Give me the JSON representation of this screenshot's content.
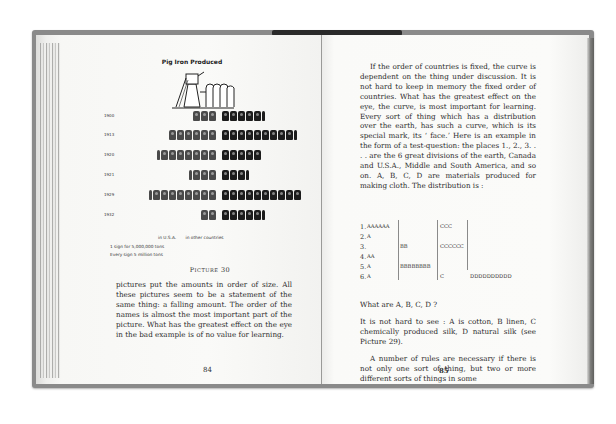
{
  "left_page": {
    "figure_title": "Pig Iron Produced",
    "caption": "Picture 30",
    "legend": {
      "usa": "in U.S.A.",
      "others": "in other countries",
      "note1": "1 sign for 5,000,000 tons",
      "note2": "Every sign 5 million tons"
    },
    "body_text": "pictures put the amounts in order of size. All these pictures seem to be a statement of the same thing: a falling amount. The order of the names is almost the most important part of the picture. What has the greatest effect on the eye in the bad example is of no value for learning.",
    "page_number": "84"
  },
  "chart_data": {
    "type": "bar",
    "title": "Pig Iron Produced",
    "subtitle": "Pictograph (isotype), 1 sign = 5,000,000 tons",
    "categories": [
      "1900",
      "1913",
      "1920",
      "1921",
      "1929",
      "1932"
    ],
    "series": [
      {
        "name": "in U.S.A.",
        "values": [
          3,
          6,
          7.5,
          3.5,
          8.5,
          2
        ]
      },
      {
        "name": "in other countries",
        "values": [
          5.5,
          9.5,
          5,
          3.5,
          10,
          5.5
        ]
      }
    ],
    "units": "signs (x 5 million tons)",
    "xlabel": "",
    "ylabel": "",
    "orientation": "horizontal",
    "grid": false,
    "legend_position": "bottom"
  },
  "right_page": {
    "para1": "If the order of countries is fixed, the curve is dependent on the thing under discussion. It is not hard to keep in memory the fixed order of countries. What has the greatest effect on the eye, the curve, is most important for learning. Every sort of thing which has a distribution over the earth, has such a curve, which is its special mark, its ‘ face.’ Here is an example in the form of a test-question: the places 1., 2., 3. . . . are the 6 great divisions of the earth, Canada and U.S.A., Middle and South America, and so on. A, B, C, D are materials produced for making cloth. The distribution is :",
    "distribution": [
      {
        "num": "1.",
        "a": "AAAAAA",
        "b": "",
        "c": "CCC",
        "d": ""
      },
      {
        "num": "2.",
        "a": "A",
        "b": "",
        "c": "",
        "d": ""
      },
      {
        "num": "3.",
        "a": "",
        "b": "BB",
        "c": "CCCCCC",
        "d": ""
      },
      {
        "num": "4.",
        "a": "AA",
        "b": "",
        "c": "",
        "d": ""
      },
      {
        "num": "5.",
        "a": "A",
        "b": "BBBBBBBB",
        "c": "",
        "d": ""
      },
      {
        "num": "6.",
        "a": "A",
        "b": "",
        "c": "C",
        "d": "DDDDDDDDDD"
      }
    ],
    "question": "What are A, B, C, D ?",
    "answer": "It is not hard to see : A is cotton, B linen, C chemically produced silk, D natural silk (see Picture 29).",
    "para3": "A number of rules are necessary if there is not only one sort of thing, but two or more different sorts of things in some",
    "page_number": "85"
  }
}
